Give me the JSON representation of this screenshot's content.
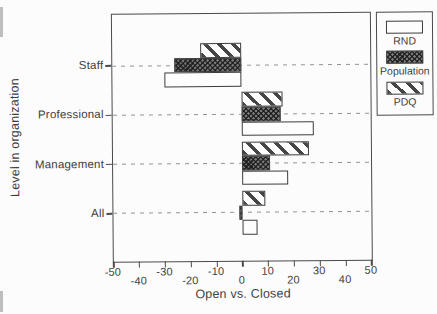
{
  "chart_data": {
    "type": "bar",
    "orientation": "horizontal",
    "title": "",
    "xlabel": "Open vs. Closed",
    "ylabel": "Level in organization",
    "xlim": [
      -50,
      50
    ],
    "xticks": [
      -50,
      -40,
      -30,
      -20,
      -10,
      0,
      10,
      20,
      30,
      40,
      50
    ],
    "grid": "dashed horizontal line at each category",
    "legend_position": "outside top-right",
    "categories": [
      "Staff",
      "Professional",
      "Management",
      "All"
    ],
    "series": [
      {
        "name": "PDQ",
        "pattern": "diagonal-stripes",
        "values": [
          -16,
          16,
          26,
          9
        ]
      },
      {
        "name": "Population",
        "pattern": "dark-crosshatch",
        "values": [
          -26,
          15,
          11,
          -1
        ]
      },
      {
        "name": "RND",
        "pattern": "open-white",
        "values": [
          -30,
          28,
          18,
          6
        ]
      }
    ],
    "legend_entries": [
      "RND",
      "Population",
      "PDQ"
    ]
  },
  "colors": {
    "ink": "#3e3e3e",
    "axis": "#4a4a4a",
    "grid": "#939393",
    "paper": "#fcfcfc"
  }
}
